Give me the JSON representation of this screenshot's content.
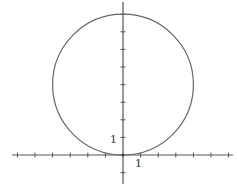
{
  "chart_data": {
    "type": "line",
    "title": "",
    "xlabel": "",
    "ylabel": "",
    "circle": {
      "center": [
        0,
        4
      ],
      "radius": 4
    },
    "equation": "x^2 + (y - 4)^2 = 16",
    "xlim": [
      -6.5,
      6.5
    ],
    "ylim": [
      -1.5,
      8.5
    ],
    "x_ticks": [
      -6,
      -5,
      -4,
      -3,
      -2,
      -1,
      1,
      2,
      3,
      4,
      5,
      6
    ],
    "y_ticks": [
      -1,
      1,
      2,
      3,
      4,
      5,
      6,
      7,
      8
    ],
    "tick_labels": {
      "x": "1",
      "y": "1"
    },
    "grid": false,
    "legend": null
  },
  "labels": {
    "x_unit": "1",
    "y_unit": "1"
  }
}
